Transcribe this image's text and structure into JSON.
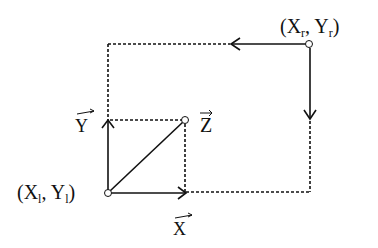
{
  "diagram": {
    "type": "vector-decomposition",
    "colors": {
      "line": "#111111",
      "background": "#ffffff",
      "point_fill": "#ffffff"
    },
    "points": {
      "right": {
        "label": "(Xr, Yr)",
        "base1": "(X",
        "sub1": "r",
        "mid": ", Y",
        "sub2": "r",
        "end": ")"
      },
      "left": {
        "label": "(Xl, Yl)",
        "base1": "(X",
        "sub1": "l",
        "mid": ", Y",
        "sub2": "l",
        "end": ")"
      },
      "z": {
        "label": "Z"
      }
    },
    "vectors": {
      "x": {
        "label": "X"
      },
      "y": {
        "label": "Y"
      },
      "z": {
        "label": "Z"
      }
    }
  }
}
